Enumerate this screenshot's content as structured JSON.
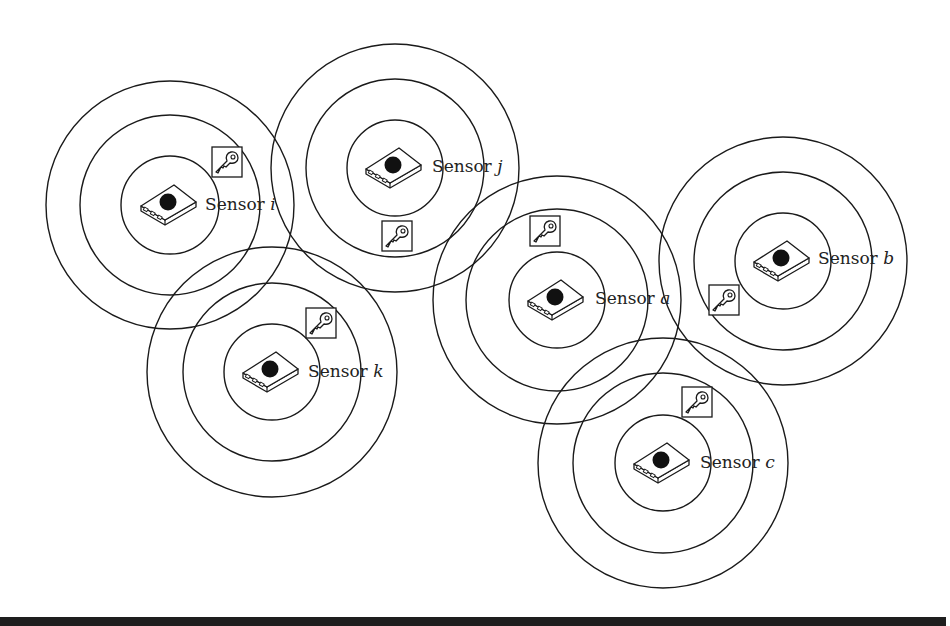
{
  "diagram": {
    "type": "sensor-network",
    "description_labels_visible_only": true,
    "colors": {
      "stroke": "#1a1a1a",
      "dot": "#111111",
      "background": "#ffffff",
      "bottom_rule": "#1e1e1e"
    },
    "sensors": [
      {
        "id": "i",
        "prefix": "Sensor",
        "var": "i",
        "cx": 170,
        "cy": 205,
        "radii": [
          49,
          90,
          124
        ],
        "label_x": 205,
        "label_y": 210,
        "key_x": 212,
        "key_y": 147
      },
      {
        "id": "j",
        "prefix": "Sensor",
        "var": "j",
        "cx": 395,
        "cy": 168,
        "radii": [
          48,
          89,
          124
        ],
        "label_x": 432,
        "label_y": 172,
        "key_x": 382,
        "key_y": 221
      },
      {
        "id": "a",
        "prefix": "Sensor",
        "var": "a",
        "cx": 557,
        "cy": 300,
        "radii": [
          48,
          91,
          124
        ],
        "label_x": 595,
        "label_y": 304,
        "key_x": 530,
        "key_y": 216
      },
      {
        "id": "b",
        "prefix": "Sensor",
        "var": "b",
        "cx": 783,
        "cy": 261,
        "radii": [
          48,
          89,
          124
        ],
        "label_x": 818,
        "label_y": 264,
        "key_x": 709,
        "key_y": 285
      },
      {
        "id": "k",
        "prefix": "Sensor",
        "var": "k",
        "cx": 272,
        "cy": 372,
        "radii": [
          48,
          89,
          125
        ],
        "label_x": 308,
        "label_y": 377,
        "key_x": 306,
        "key_y": 308
      },
      {
        "id": "c",
        "prefix": "Sensor",
        "var": "c",
        "cx": 663,
        "cy": 463,
        "radii": [
          48,
          90,
          125
        ],
        "label_x": 700,
        "label_y": 468,
        "key_x": 682,
        "key_y": 387
      }
    ],
    "icons": {
      "sensor": "sensor-device-icon",
      "key": "key-icon"
    }
  }
}
